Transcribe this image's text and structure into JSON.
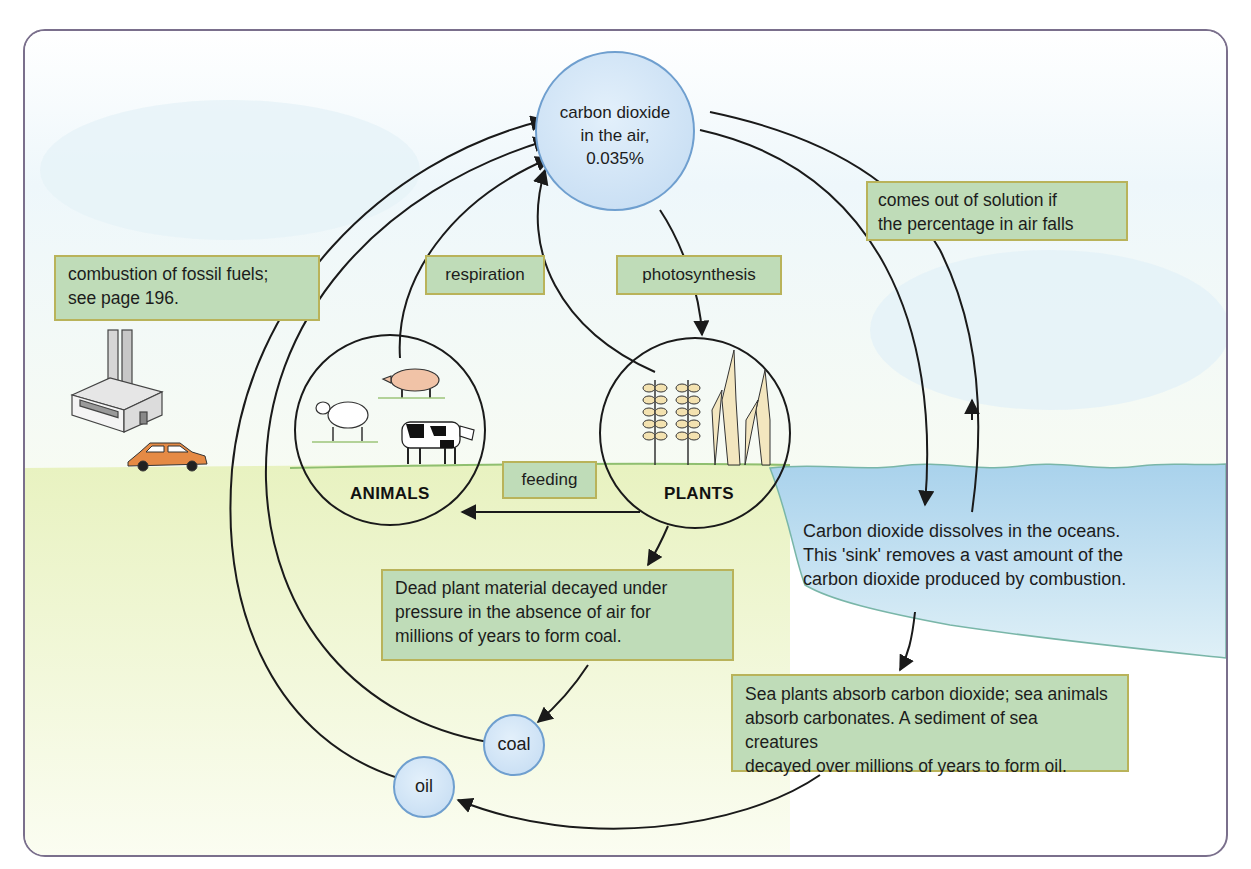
{
  "diagram": {
    "nodes": {
      "co2_air": {
        "line1": "carbon dioxide",
        "line2": "in the air,",
        "line3": "0.035%"
      },
      "animals": {
        "label": "ANIMALS"
      },
      "plants": {
        "label": "PLANTS"
      },
      "coal": {
        "label": "coal"
      },
      "oil": {
        "label": "oil"
      }
    },
    "labels": {
      "combustion": {
        "line1": "combustion of fossil fuels;",
        "line2": "see page 196."
      },
      "respiration": "respiration",
      "photosynthesis": "photosynthesis",
      "feeding": "feeding",
      "solution": {
        "line1": "comes out of solution if",
        "line2": "the percentage in air falls"
      },
      "dead_plant": {
        "line1": "Dead plant material decayed under",
        "line2": "pressure in the absence of air for",
        "line3": "millions of years to form coal."
      },
      "ocean": {
        "line1": "Carbon dioxide dissolves in the oceans.",
        "line2": "This 'sink' removes a vast amount of the",
        "line3": "carbon dioxide produced by combustion."
      },
      "sea_plants": {
        "line1": "Sea plants absorb carbon dioxide; sea animals",
        "line2": "absorb carbonates. A sediment of sea creatures",
        "line3": "decayed over millions of years to form oil."
      }
    },
    "edges": [
      {
        "from": "co2_air",
        "to": "plants",
        "label": "photosynthesis"
      },
      {
        "from": "animals",
        "to": "co2_air",
        "label": "respiration"
      },
      {
        "from": "plants",
        "to": "co2_air",
        "label": "respiration"
      },
      {
        "from": "plants",
        "to": "animals",
        "label": "feeding"
      },
      {
        "from": "plants",
        "to": "coal",
        "label": "Dead plant material decayed under pressure..."
      },
      {
        "from": "coal",
        "to": "co2_air",
        "label": "combustion of fossil fuels"
      },
      {
        "from": "oil",
        "to": "co2_air",
        "label": "combustion of fossil fuels"
      },
      {
        "from": "co2_air",
        "to": "ocean",
        "label": "dissolves"
      },
      {
        "from": "ocean",
        "to": "co2_air",
        "label": "comes out of solution if the percentage in air falls"
      },
      {
        "from": "ocean",
        "to": "sea_sediment",
        "label": "Sea plants absorb carbon dioxide..."
      },
      {
        "from": "sea_sediment",
        "to": "oil",
        "label": "form oil"
      }
    ],
    "colors": {
      "frame_border": "#7a6f8c",
      "label_fill": "#bfdcb8",
      "label_border": "#b9b35a",
      "bubble_fill": "#cfe3f5",
      "bubble_border": "#6f9fcf",
      "ocean_fill": "#bcdcef",
      "ground_fill": "#eef5c8"
    }
  }
}
